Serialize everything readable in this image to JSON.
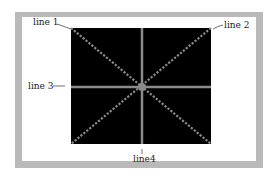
{
  "diagram": {
    "labels": {
      "line1": "line 1",
      "line2": "line 2",
      "line3": "line 3",
      "line4": "line4"
    },
    "colors": {
      "frame": "#b9b9b9",
      "panel": "#ffffff",
      "square": "#000000",
      "lines": "#8a8a8a"
    }
  }
}
